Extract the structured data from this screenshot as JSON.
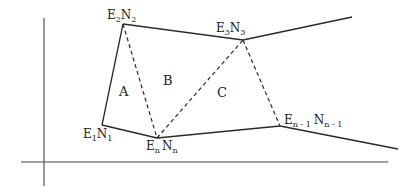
{
  "diagram": {
    "type": "traverse-polygon-triangulation",
    "axes": {
      "horizontal": {
        "x1": 21,
        "y1": 162,
        "x2": 388,
        "y2": 162
      },
      "vertical": {
        "x1": 44,
        "y1": 18,
        "x2": 44,
        "y2": 186
      }
    },
    "vertices": [
      {
        "id": "1",
        "E": "E",
        "e_sub": "1",
        "N": "N",
        "n_sub": "1",
        "x": 102,
        "y": 125
      },
      {
        "id": "2",
        "E": "E",
        "e_sub": "2",
        "N": "N",
        "n_sub": "2",
        "x": 123,
        "y": 24
      },
      {
        "id": "3",
        "E": "E",
        "e_sub": "3",
        "N": "N",
        "n_sub": "3",
        "x": 243,
        "y": 40
      },
      {
        "id": "n-1",
        "E": "E",
        "e_sub": "n - 1",
        "N": "N",
        "n_sub": "n - 1",
        "x": 280,
        "y": 126
      },
      {
        "id": "n",
        "E": "E",
        "e_sub": "n",
        "N": "N",
        "n_sub": "n",
        "x": 157,
        "y": 138
      }
    ],
    "solid_edges": [
      [
        "1",
        "2"
      ],
      [
        "2",
        "3"
      ],
      [
        "1",
        "n"
      ],
      [
        "n",
        "n-1"
      ]
    ],
    "open_edges": [
      {
        "from": "3",
        "to_x": 352,
        "to_y": 17
      },
      {
        "from": "n-1",
        "to_x": 398,
        "to_y": 149
      }
    ],
    "dashed_edges": [
      [
        "2",
        "n"
      ],
      [
        "n",
        "3"
      ],
      [
        "3",
        "n-1"
      ]
    ],
    "regions": [
      {
        "label": "A",
        "x": 119,
        "y": 96
      },
      {
        "label": "B",
        "x": 163,
        "y": 85
      },
      {
        "label": "C",
        "x": 217,
        "y": 97
      }
    ],
    "colors": {
      "line": "#2a2a2a",
      "text": "#222222",
      "background": "#ffffff"
    }
  }
}
